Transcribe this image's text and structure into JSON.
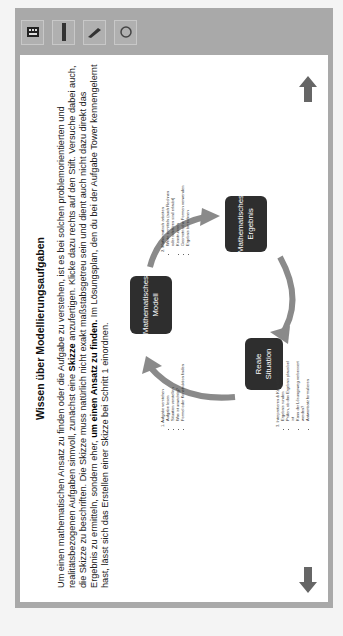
{
  "toolbar": {
    "tools": [
      {
        "name": "keyboard-icon",
        "label": "Tastatur"
      },
      {
        "name": "ruler-icon",
        "label": "Lineal"
      },
      {
        "name": "pen-icon",
        "label": "Stift"
      },
      {
        "name": "eraser-icon",
        "label": "Radierer"
      }
    ]
  },
  "content": {
    "title": "Wissen über Modellierungsaufgaben",
    "intro_part1": "Um einen mathematischen Ansatz zu finden oder die Aufgabe zu verstehen, ist es bei solchen problemorientierten und realitätsbezogenen Aufgaben sinnvoll, zunächst eine ",
    "intro_bold1": "Skizze",
    "intro_part2": " anzufertigen. Klicke dazu rechts auf den Stift. Versuche dabei auch, die Skizze zu beschriften. Die Skizze muss natürlich nicht exakt maßstabsgetreu sein und dient auch nicht dazu direkt das Ergebnis zu ermitteln, sondern eher, ",
    "intro_bold2": "um einen Ansatz zu finden.",
    "intro_part3": " Im Lösungsplan, den du bei der Aufgabe Tower kennengelernt hast, lässt sich das Erstellen einer Skizze bei Schritt 1 einordnen."
  },
  "diagram": {
    "nodes": {
      "real": "Reale Situation",
      "model": "Mathematisches Modell",
      "result": "Mathematisches Ergebnis"
    },
    "step1": {
      "title": "1. Aufgabe verstehen",
      "items": [
        "Aufgabe lesen",
        "Situation vorstellen",
        "Was ist unwichtig?",
        "Formel oder Konstruktion finden"
      ]
    },
    "step2": {
      "title": "2. Mathematisch arbeiten",
      "items": [
        "Werte ermitteln (auch Rechnen oder schätzen sind erlaubt)",
        "Konstruieren",
        "Geometrische Formen verwenden",
        "Ergebnis berechnen"
      ]
    },
    "step3": {
      "title": "3. Interpretieren & Kontrollieren",
      "items": [
        "Ergebnis runden",
        "Prüfen, ob das Ergebnis plausibel ist",
        "Kann der Lösungsweg verbessert werden?",
        "Antwortsatz formulieren"
      ]
    }
  },
  "nav": {
    "prev": "previous-page",
    "next": "next-page"
  },
  "colors": {
    "frame": "#a9a9a9",
    "node": "#2e2e2e",
    "arrow": "#8a8a8a"
  }
}
